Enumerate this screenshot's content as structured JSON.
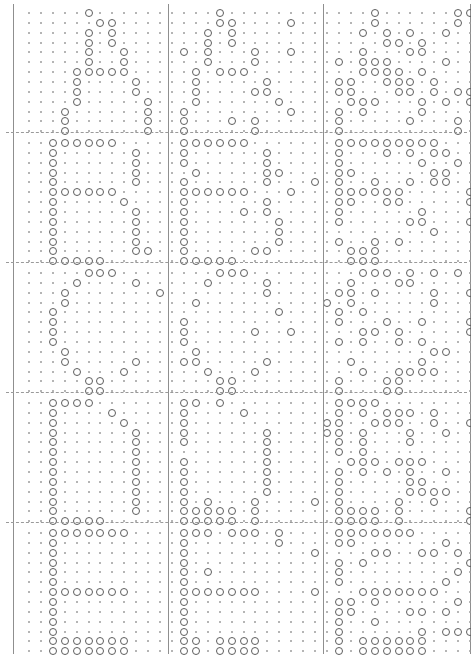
{
  "figure": {
    "kind": "dot-matrix-letter-grid",
    "rows": 5,
    "columns": 3,
    "matrix_rows": 13,
    "matrix_columns": 13,
    "on_symbol": "o",
    "off_symbol": ".",
    "colors": {
      "background": "#ffffff",
      "on_mark": "#5d5d5d",
      "off_mark": "#9c9c9c",
      "cell_border": "#8f8f8f",
      "row_separator": "#9a9a9a"
    }
  },
  "chart_data": {
    "type": "heatmap",
    "title": "",
    "xlabel": "",
    "ylabel": "",
    "grid": false,
    "legend": "none",
    "row_labels": [
      "A",
      "B",
      "C",
      "D",
      "E"
    ],
    "column_labels": [
      "sample-1",
      "sample-2",
      "sample-3"
    ],
    "cells": [
      {
        "letter": "A",
        "variant": 1,
        "rows": [
          ".....o.......",
          "......oo.....",
          ".....o.o.....",
          ".....o.o.....",
          ".....o..o....",
          ".....o..o....",
          "....ooooo....",
          "....o....o...",
          "....o....o...",
          "....o.....o..",
          "...o......o..",
          "...o......o..",
          "...o......o.."
        ]
      },
      {
        "letter": "A",
        "variant": 2,
        "rows": [
          "...o.........",
          "...oo....o...",
          "..o.o........",
          "..o.o........",
          "o.o...o..o...",
          "..o...o......",
          ".o.ooo.......",
          ".o.....o.....",
          ".o....oo.....",
          ".o......o....",
          "o........o...",
          "o...o.o......",
          "o.....o......"
        ]
      },
      {
        "letter": "A",
        "variant": 3,
        "rows": [
          "...o......oo.",
          "...o......o..",
          "..o.o.o..o...",
          "....oo.o....o",
          "..o...oo.....",
          "o.ooo....o..o",
          "..oooo.o....o",
          "oo..ooo.o....",
          "oo...oo.o.oo.",
          ".ooo...o.o.o.",
          "o.o....o.....",
          "o.....o...o..",
          "o.........o.."
        ]
      },
      {
        "letter": "B",
        "variant": 1,
        "rows": [
          "..oooooo.....",
          "..o......o...",
          "..o......o...",
          "..o......o...",
          "..o......o...",
          "..oooooo.....",
          "..o.....o....",
          "..o......o...",
          "..o......o...",
          "..o......o...",
          "..o......o...",
          "..o......oo..",
          "..ooooo......"
        ]
      },
      {
        "letter": "B",
        "variant": 2,
        "rows": [
          "oooooo.......",
          "o......o.....",
          "o......o.....",
          ".o.....oo....",
          "o......o...o.",
          "oooooo...o...",
          "o......o.....",
          "o....o.o.....",
          "o.......o....",
          "o.......o....",
          "o.......o....",
          "o.....oo.....",
          "ooooo........"
        ]
      },
      {
        "letter": "B",
        "variant": 3,
        "rows": [
          "ooooooooo....",
          "o...o.o.oo...",
          "o......o..o.o",
          "oo......oo..o",
          "o..o..o.oo...",
          "oooooo.....oo",
          "oo..oo.....o.",
          "o......o.....",
          "o.....oo...o.",
          "........o....",
          "o..o.o.......",
          ".ooo.........",
          ".ooo........."
        ]
      },
      {
        "letter": "C",
        "variant": 1,
        "rows": [
          ".....ooo.....",
          "....o....o...",
          "...o.......o.",
          "...o.........",
          "..o..........",
          "..o..........",
          "..o..........",
          "..o..........",
          "...o.........",
          "...o.....o...",
          "....o...o....",
          ".....oo......",
          ".....oo......"
        ]
      },
      {
        "letter": "C",
        "variant": 2,
        "rows": [
          "...ooo.......",
          "..o....o.....",
          ".......o.....",
          ".o..........o",
          "........o....",
          "o............",
          "o.....o..o...",
          "o............",
          ".o...........",
          "oo.....o.....",
          "..o...o......",
          "...oo........",
          "...oo........"
        ]
      },
      {
        "letter": "C",
        "variant": 3,
        "rows": [
          "..ooo.o.o.o..",
          ".o...oo......",
          "oo.o....o..o.",
          ".o......o....",
          "o.o..........",
          "o...o..o...o.",
          "..oo.o.....oo",
          "o.o..o.o.....",
          "........oo..o",
          ".o.....o.....",
          "..o..oooo....",
          "o...oo.......",
          "o...oo......."
        ]
      },
      {
        "letter": "D",
        "variant": 1,
        "rows": [
          "..oooo.......",
          "..o....o.....",
          "..o.....o....",
          "..o......o...",
          "..o......o...",
          "..o......o...",
          "..o......o...",
          "..o......o...",
          "..o......o...",
          "..o......o...",
          "..o......o...",
          "..o......o...",
          "..ooooo......"
        ]
      },
      {
        "letter": "D",
        "variant": 2,
        "rows": [
          "oo.o.........",
          "o....o.......",
          "o...........o",
          "o......o....o",
          "o......o.....",
          ".......o.....",
          "o......o.....",
          "o......o.....",
          "o......o.....",
          "o......o.....",
          "o.o...o....o.",
          "ooooo.o......",
          "ooooo.o......"
        ]
      },
      {
        "letter": "D",
        "variant": 3,
        "rows": [
          "oooo.........",
          "o.o.ooo.o....",
          "o..ooo..o..o.",
          "o.o...o..o...",
          "o.o...o......",
          "o.o..........",
          ".ooo.ooo.....",
          "o.o.o.o..o...",
          "o.....oo.....",
          "o.....oooo...",
          "o....o..o....",
          "oooo.o.....oo",
          "oooo.o.....oo"
        ]
      },
      {
        "letter": "E",
        "variant": 1,
        "rows": [
          "..ooooooo....",
          "..o..........",
          "..o..........",
          "..o..........",
          "..o..........",
          "..o..........",
          "..ooooooo....",
          "..o..........",
          "..o..........",
          "..o..........",
          "..o..........",
          "..ooooooo....",
          "..ooooooo...."
        ]
      },
      {
        "letter": "E",
        "variant": 2,
        "rows": [
          "ooo.ooo.o....",
          "o.......o....",
          "o..........o.",
          "o............",
          "o.o..........",
          "o............",
          "ooooooo....o.",
          "o............",
          "o............",
          "o............",
          "o............",
          "oo.oooo......",
          "oo.oooo......"
        ]
      },
      {
        "letter": "E",
        "variant": 3,
        "rows": [
          "ooooooo......",
          "oo.......o...",
          "...oo..oo.o..",
          "o.o........o.",
          "o.........o.o",
          "o........o..o",
          "..ooooooo....",
          "oo.o......o..",
          "oo....oo.o...",
          "o..o.........",
          "o......o.ooo.",
          "o.oooooo.....",
          "o.oooooo....."
        ]
      }
    ]
  }
}
